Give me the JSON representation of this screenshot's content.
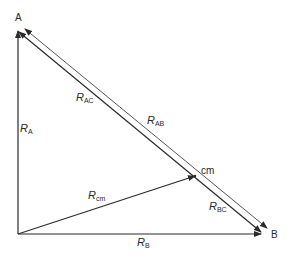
{
  "diagram": {
    "points": {
      "A": "A",
      "B": "B",
      "cm": "cm"
    },
    "vectors": [
      {
        "id": "R_A",
        "symbol": "R",
        "subscript": "A"
      },
      {
        "id": "R_B",
        "symbol": "R",
        "subscript": "B"
      },
      {
        "id": "R_cm",
        "symbol": "R",
        "subscript": "cm"
      },
      {
        "id": "R_AC",
        "symbol": "R",
        "subscript": "AC"
      },
      {
        "id": "R_BC",
        "symbol": "R",
        "subscript": "BC"
      },
      {
        "id": "R_AB",
        "symbol": "R",
        "subscript": "AB"
      }
    ],
    "colors": {
      "line": "#2a2a2a",
      "background": "#ffffff"
    }
  }
}
